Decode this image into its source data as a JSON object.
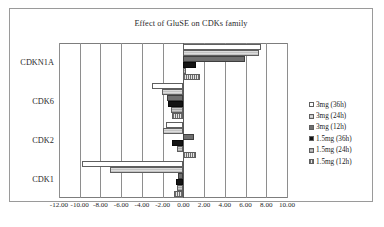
{
  "chart_data": {
    "type": "bar",
    "orientation": "horizontal",
    "title": "Effect of GluSE on CDKs family",
    "xlabel": "",
    "ylabel": "",
    "categories": [
      "CDKN1A",
      "CDK6",
      "CDK2",
      "CDK1"
    ],
    "xlim": [
      -12.0,
      10.0
    ],
    "xticks": [
      "-12.00",
      "-10.00",
      "-8.00",
      "-6.00",
      "-4.00",
      "-2.00",
      "0.00",
      "2.00",
      "4.00",
      "6.00",
      "8.00",
      "10.00"
    ],
    "xtick_values": [
      -12,
      -10,
      -8,
      -6,
      -4,
      -2,
      0,
      2,
      4,
      6,
      8,
      10
    ],
    "grid": true,
    "legend_position": "right",
    "series": [
      {
        "name": "3mg (36h)",
        "values": [
          7.5,
          -3.0,
          -1.7,
          -9.8
        ]
      },
      {
        "name": "3mg (24h)",
        "values": [
          7.3,
          -2.1,
          -2.0,
          -7.1
        ]
      },
      {
        "name": "3mg (12h)",
        "values": [
          5.9,
          -1.6,
          1.0,
          -0.5
        ]
      },
      {
        "name": "1.5mg (36h)",
        "values": [
          1.2,
          -1.5,
          -1.1,
          -0.7
        ]
      },
      {
        "name": "1.5mg (24h)",
        "values": [
          0.3,
          -1.2,
          -0.6,
          -0.6
        ]
      },
      {
        "name": "1.5mg (12h)",
        "values": [
          1.6,
          -1.1,
          1.2,
          -0.9
        ]
      }
    ]
  },
  "legend": {
    "items": [
      {
        "label": "3mg (36h)"
      },
      {
        "label": "3mg (24h)"
      },
      {
        "label": "3mg (12h)"
      },
      {
        "label": "1.5mg (36h)"
      },
      {
        "label": "1.5mg (24h)"
      },
      {
        "label": "1.5mg (12h)"
      }
    ]
  },
  "caption": {
    "text": ""
  }
}
